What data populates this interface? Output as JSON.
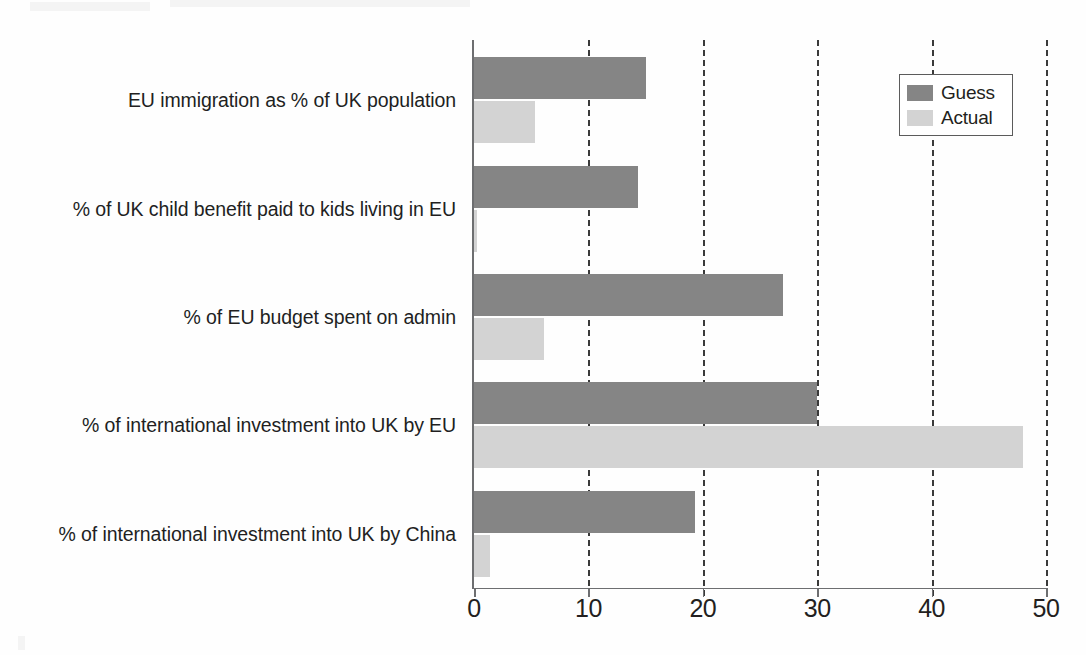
{
  "chart_data": {
    "type": "bar",
    "orientation": "horizontal",
    "title": "",
    "xlabel": "",
    "ylabel": "",
    "xlim": [
      0,
      50
    ],
    "xticks": [
      0,
      10,
      20,
      30,
      40,
      50
    ],
    "xtick_labels": [
      "0",
      "10",
      "20",
      "30",
      "40",
      "50"
    ],
    "grid": true,
    "grid_axis": "x",
    "grid_style": "dashed",
    "legend_position": "top-right",
    "categories": [
      "EU immigration as % of UK population",
      "% of UK child benefit paid to kids living in EU",
      "% of EU budget spent on admin",
      "% of international investment into UK by EU",
      "% of international investment into UK by China"
    ],
    "series": [
      {
        "name": "Guess",
        "color": "#858585",
        "values": [
          15,
          14.3,
          27,
          30,
          19.3
        ]
      },
      {
        "name": "Actual",
        "color": "#d3d3d3",
        "values": [
          5.3,
          0.3,
          6.1,
          48,
          1.4
        ]
      }
    ]
  },
  "legend": {
    "items": [
      {
        "label": "Guess",
        "swatch": "guess-swatch"
      },
      {
        "label": "Actual",
        "swatch": "actual-swatch"
      }
    ]
  },
  "colors": {
    "guess": "#858585",
    "actual": "#d3d3d3",
    "axis": "#6d6e70",
    "gridline": "#3a3a3a",
    "text": "#231f20",
    "background": "#fefefe"
  }
}
